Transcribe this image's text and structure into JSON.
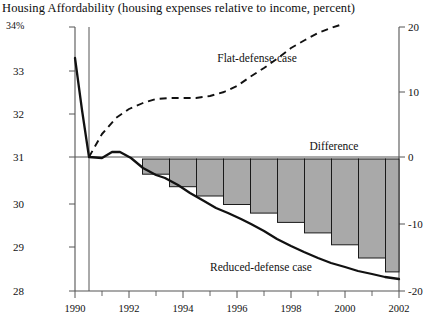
{
  "chart_data": {
    "type": "line",
    "title": "Housing Affordability (housing expenses relative to income, percent)",
    "xlabel": "",
    "ylabel": "",
    "grid": false,
    "legend_position": "inline-annotations",
    "x": [
      1990,
      1991,
      1992,
      1993,
      1994,
      1995,
      1996,
      1997,
      1998,
      1999,
      2000,
      2001,
      2002
    ],
    "xlim": [
      1990,
      2002
    ],
    "xtick_labels": [
      "1990",
      "1992",
      "1994",
      "1996",
      "1998",
      "2000",
      "2002"
    ],
    "xticks_major": [
      1990,
      1992,
      1994,
      1996,
      1998,
      2000,
      2002
    ],
    "xticks_minor": [
      1991,
      1993,
      1995,
      1997,
      1999,
      2001
    ],
    "left_axis": {
      "label": "34%",
      "unit": "percent",
      "ylim": [
        28,
        34
      ],
      "ticks": [
        28,
        29,
        30,
        31,
        32,
        33,
        34
      ],
      "tick_labels": [
        "28",
        "29",
        "30",
        "31",
        "32",
        "33",
        "34%"
      ]
    },
    "right_axis": {
      "ylim": [
        -20,
        20
      ],
      "ticks": [
        -20,
        -10,
        0,
        10,
        20
      ],
      "tick_labels": [
        "-20",
        "-10",
        "0",
        "10",
        "20"
      ]
    },
    "series": [
      {
        "name": "Reduced-defense case",
        "style": "solid",
        "axis": "left",
        "annotation": "Reduced-defense case",
        "values": [
          33.35,
          31.45,
          31.0,
          31.1,
          30.85,
          30.6,
          30.45,
          30.2,
          29.9,
          29.55,
          29.15,
          28.75,
          28.45
        ]
      },
      {
        "name": "Flat-defense case",
        "style": "dashed",
        "axis": "left",
        "annotation": "Flat-defense case",
        "values": [
          null,
          null,
          31.0,
          31.45,
          31.7,
          31.9,
          32.0,
          32.0,
          32.05,
          32.2,
          32.45,
          32.75,
          33.1
        ]
      },
      {
        "name": "Difference",
        "style": "bars",
        "axis": "right",
        "annotation": "Difference",
        "values": [
          null,
          null,
          0,
          -2.3,
          -4.2,
          -5.6,
          -6.9,
          -8.2,
          -9.6,
          -11.2,
          -13.0,
          -15.0,
          -17.1
        ]
      }
    ],
    "annotations": [
      {
        "text": "Flat-defense case",
        "x": 1995.4,
        "y": 32.6
      },
      {
        "text": "Difference",
        "x": 1999.6,
        "y": 31.35
      },
      {
        "text": "Reduced-defense case",
        "x": 1996.9,
        "y": 29.0
      }
    ],
    "vertical_reference_line": {
      "x": 1992,
      "description": "divider between history and projection"
    },
    "zero_reference_line": {
      "left_value": 31,
      "right_value": 0
    },
    "colors": {
      "line": "#111111",
      "bar_fill": "#a9a9a9",
      "bar_edge": "#1a1a1a",
      "axis": "#555555",
      "text": "#111111"
    }
  }
}
